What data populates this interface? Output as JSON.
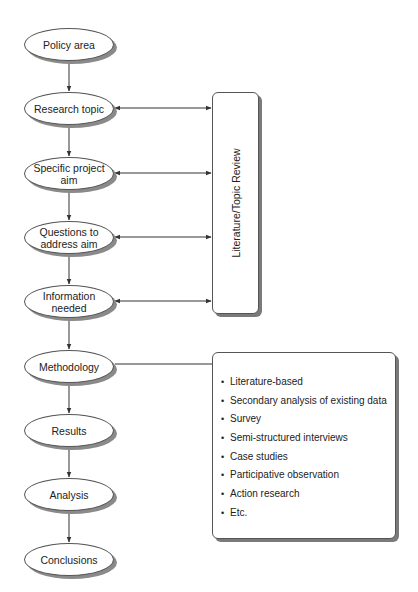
{
  "flow": {
    "nodes": [
      {
        "id": "policy-area",
        "label": "Policy area",
        "cy": 44
      },
      {
        "id": "research-topic",
        "label": "Research topic",
        "cy": 108
      },
      {
        "id": "specific-project-aim",
        "label": "Specific project\naim",
        "cy": 173
      },
      {
        "id": "questions-to-address-aim",
        "label": "Questions to\naddress aim",
        "cy": 237
      },
      {
        "id": "information-needed",
        "label": "Information\nneeded",
        "cy": 301
      },
      {
        "id": "methodology",
        "label": "Methodology",
        "cy": 366
      },
      {
        "id": "results",
        "label": "Results",
        "cy": 430
      },
      {
        "id": "analysis",
        "label": "Analysis",
        "cy": 494
      },
      {
        "id": "conclusions",
        "label": "Conclusions",
        "cy": 559
      }
    ]
  },
  "review_box": {
    "label": "Literature/Topic Review",
    "linked_nodes": [
      "research-topic",
      "specific-project-aim",
      "questions-to-address-aim",
      "information-needed"
    ]
  },
  "methods_box": {
    "linked_node": "methodology",
    "bullet": "•",
    "items": [
      "Literature-based",
      "Secondary analysis of existing data",
      "Survey",
      "Semi-structured interviews",
      "Case studies",
      "Participative observation",
      "Action research",
      "Etc."
    ]
  },
  "colors": {
    "line": "#333333",
    "shadow": "#8a8a8a",
    "fill": "#ffffff"
  }
}
